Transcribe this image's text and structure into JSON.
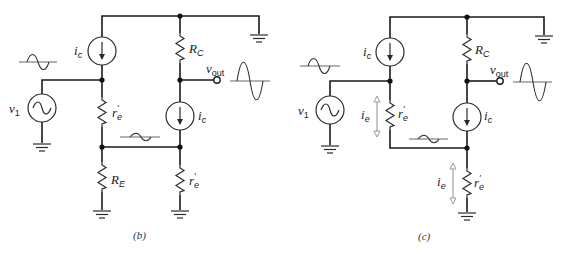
{
  "figure": {
    "panels": [
      {
        "caption": "(b)",
        "labels": {
          "source": "v",
          "source_sub": "1",
          "ic_top": "i",
          "ic_top_sub": "c",
          "ic_bottom": "i",
          "ic_bottom_sub": "c",
          "rc": "R",
          "rc_sub": "C",
          "re": "R",
          "re_sub": "E",
          "re_prime_left": "r",
          "re_prime_left_sub": "e",
          "re_prime_right": "r",
          "re_prime_right_sub": "e",
          "vout": "v",
          "vout_sub": "out"
        }
      },
      {
        "caption": "(c)",
        "labels": {
          "source": "v",
          "source_sub": "1",
          "ic_top": "i",
          "ic_top_sub": "c",
          "ic_bottom": "i",
          "ic_bottom_sub": "c",
          "rc": "R",
          "rc_sub": "C",
          "ie_left": "i",
          "ie_left_sub": "e",
          "ie_right": "i",
          "ie_right_sub": "e",
          "re_prime_left": "r",
          "re_prime_left_sub": "e",
          "re_prime_right": "r",
          "re_prime_right_sub": "e",
          "vout": "v",
          "vout_sub": "out"
        }
      }
    ],
    "colors": {
      "wire": "#1a1a1a",
      "current_arrow": "#999999",
      "background": "#ffffff"
    }
  }
}
